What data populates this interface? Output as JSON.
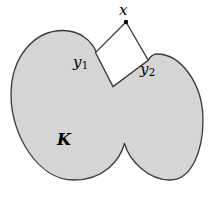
{
  "figure": {
    "caption_labels": {
      "x": "x",
      "y1_base": "y",
      "y1_sub": "1",
      "y2_base": "y",
      "y2_sub": "2",
      "K": "K"
    },
    "colors": {
      "background": "#ffffff",
      "body_fill": "#d5d5d5",
      "outline": "#3a3a3a",
      "quad_fill": "#ffffff",
      "quad_stroke": "#3a3a3a",
      "point_marker": "#000000"
    },
    "geometry": {
      "canvas": {
        "width": 213,
        "height": 206
      },
      "body_outline_path": "M 96.5,52.5 C 92,41 80,30.5 63,30.5 C 34,30.5 11,57 11,95 C 11,135 38,180 74,180 C 104,180 120,160 124.5,143.5 C 129,160 148,180 170,180 C 192,180 203,150 203,120 C 203,84 181,54 157,54 C 152,54 150,57 148.2,60.2 L 113,86.5 Z",
      "quad_path": "M 126,22 L 95.5,52.5 L 113,86.5 L 148.2,60.2 Z",
      "apex_point": {
        "x": 126,
        "y": 22,
        "radius": 2.2
      },
      "y1_point": {
        "x": 95.5,
        "y": 52.5
      },
      "y2_point": {
        "x": 148.2,
        "y": 60.2
      },
      "stroke_width": 1.3
    }
  }
}
